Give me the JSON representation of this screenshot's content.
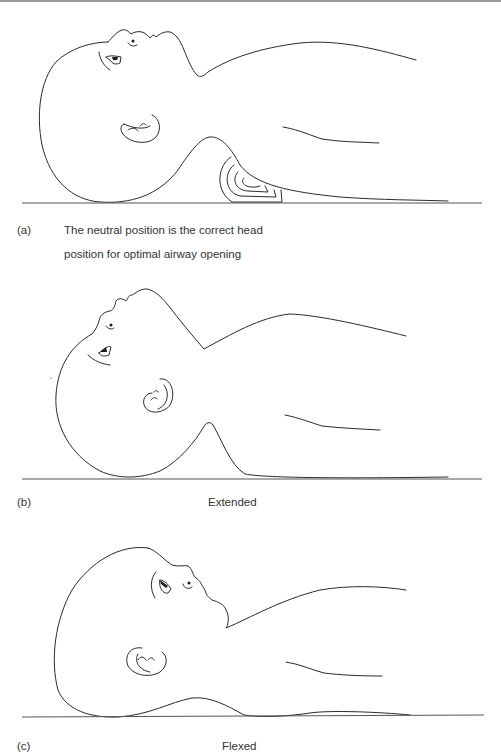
{
  "figure": {
    "panels": [
      {
        "id": "a",
        "letter": "(a)",
        "position_name": "Neutral",
        "caption_line1": "The neutral position is the correct head",
        "caption_line2": "position for optimal airway opening",
        "support": "folded towel roll under shoulders"
      },
      {
        "id": "b",
        "letter": "(b)",
        "position_name": "Extended",
        "caption": "Extended"
      },
      {
        "id": "c",
        "letter": "(c)",
        "position_name": "Flexed",
        "caption": "Flexed"
      }
    ],
    "colors": {
      "line": "#2a2a2a",
      "ground": "#555555",
      "text": "#333333",
      "top_rule": "#9a9a9a"
    }
  }
}
